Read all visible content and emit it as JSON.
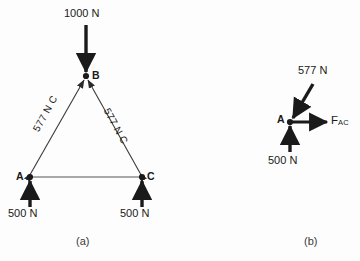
{
  "figure": {
    "background": "#fdfdfd",
    "ink": "#1a1a1a",
    "chord_color": "#8c8c8c"
  },
  "panel_a": {
    "caption": "(a)",
    "joints": {
      "a_label": "A",
      "b_label": "B",
      "c_label": "C"
    },
    "loads": {
      "top_label": "1000 N",
      "left_reaction_label": "500 N",
      "right_reaction_label": "500 N"
    },
    "members": {
      "ab_label": "577 N C",
      "bc_label": "577 N C"
    }
  },
  "panel_b": {
    "caption": "(b)",
    "joint_label": "A",
    "diagonal_force_label": "577 N",
    "vertical_force_label": "500 N",
    "horizontal_force_main": "F",
    "horizontal_force_sub": "AC"
  }
}
